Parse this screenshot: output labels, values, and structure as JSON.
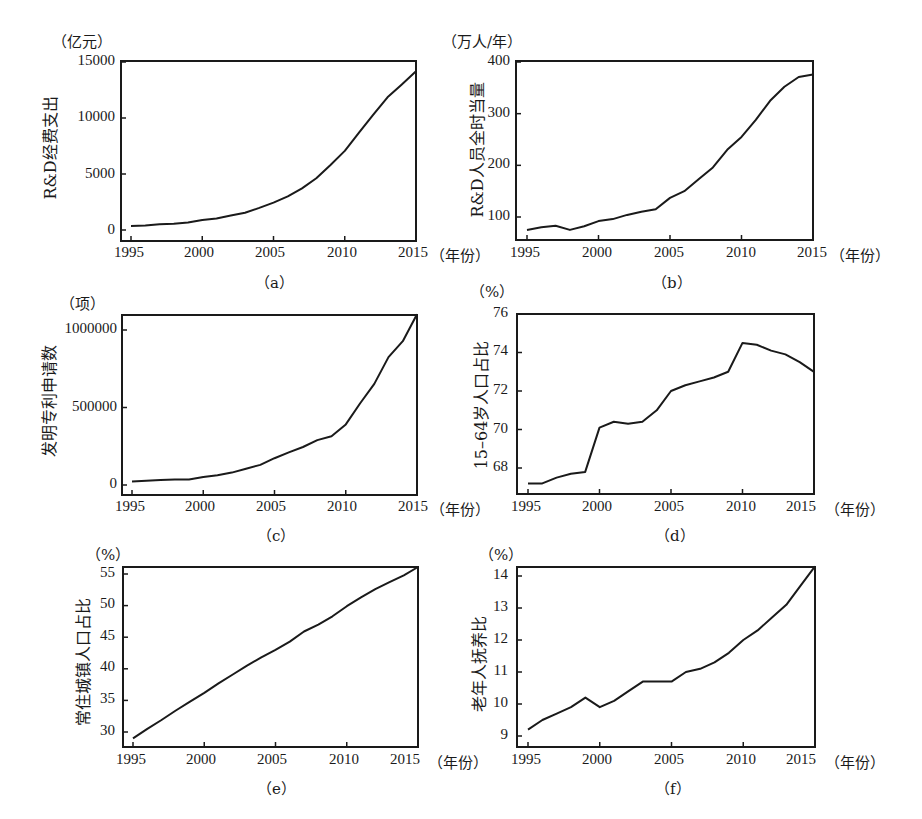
{
  "x_axis_unit": "（年份）",
  "chart_data": [
    {
      "id": "a",
      "type": "line",
      "caption": "（a）",
      "unit": "（亿元）",
      "ylabel": "R&D经费支出",
      "xlabel": "年份",
      "x_ticks": [
        "1995",
        "2000",
        "2005",
        "2010",
        "2015"
      ],
      "y_ticks": [
        "0",
        "5000",
        "10000",
        "15000"
      ],
      "ylim": [
        0,
        15000
      ],
      "xlim": [
        1995,
        2015
      ],
      "x": [
        1995,
        1996,
        1997,
        1998,
        1999,
        2000,
        2001,
        2002,
        2003,
        2004,
        2005,
        2006,
        2007,
        2008,
        2009,
        2010,
        2011,
        2012,
        2013,
        2014,
        2015
      ],
      "values": [
        350,
        400,
        510,
        550,
        680,
        900,
        1040,
        1290,
        1540,
        1970,
        2450,
        3000,
        3710,
        4620,
        5800,
        7060,
        8690,
        10300,
        11850,
        13000,
        14170
      ]
    },
    {
      "id": "b",
      "type": "line",
      "caption": "（b）",
      "unit": "（万人/年）",
      "ylabel": "R&D人员全时当量",
      "xlabel": "年份",
      "x_ticks": [
        "1995",
        "2000",
        "2005",
        "2010",
        "2015"
      ],
      "y_ticks": [
        "100",
        "200",
        "300",
        "400"
      ],
      "ylim": [
        55,
        400
      ],
      "xlim": [
        1995,
        2015
      ],
      "x": [
        1995,
        1996,
        1997,
        1998,
        1999,
        2000,
        2001,
        2002,
        2003,
        2004,
        2005,
        2006,
        2007,
        2008,
        2009,
        2010,
        2011,
        2012,
        2013,
        2014,
        2015
      ],
      "values": [
        75,
        80,
        83,
        75,
        82,
        92,
        96,
        104,
        110,
        115,
        137,
        150,
        173,
        196,
        230,
        255,
        288,
        325,
        352,
        371,
        376
      ]
    },
    {
      "id": "c",
      "type": "line",
      "caption": "（c）",
      "unit": "（项）",
      "ylabel": "发明专利申请数",
      "xlabel": "年份",
      "x_ticks": [
        "1995",
        "2000",
        "2005",
        "2010",
        "2015"
      ],
      "y_ticks": [
        "0",
        "500000",
        "1000000"
      ],
      "ylim": [
        -30000,
        1100000
      ],
      "xlim": [
        1995,
        2015
      ],
      "x": [
        1995,
        1996,
        1997,
        1998,
        1999,
        2000,
        2001,
        2002,
        2003,
        2004,
        2005,
        2006,
        2007,
        2008,
        2009,
        2010,
        2011,
        2012,
        2013,
        2014,
        2015
      ],
      "values": [
        22000,
        28000,
        33000,
        35000,
        36000,
        52000,
        63000,
        80000,
        105000,
        130000,
        173000,
        210000,
        245000,
        290000,
        315000,
        391000,
        526000,
        652000,
        825000,
        928000,
        1102000
      ]
    },
    {
      "id": "d",
      "type": "line",
      "caption": "（d）",
      "unit": "（%）",
      "ylabel": "15–64岁人口占比",
      "xlabel": "年份",
      "x_ticks": [
        "1995",
        "2000",
        "2005",
        "2010",
        "2015"
      ],
      "y_ticks": [
        "68",
        "70",
        "72",
        "74",
        "76"
      ],
      "ylim": [
        66.7,
        76
      ],
      "xlim": [
        1995,
        2015
      ],
      "x": [
        1995,
        1996,
        1997,
        1998,
        1999,
        2000,
        2001,
        2002,
        2003,
        2004,
        2005,
        2006,
        2007,
        2008,
        2009,
        2010,
        2011,
        2012,
        2013,
        2014,
        2015
      ],
      "values": [
        67.2,
        67.2,
        67.5,
        67.7,
        67.8,
        70.1,
        70.4,
        70.3,
        70.4,
        71.0,
        72.0,
        72.3,
        72.5,
        72.7,
        73.0,
        74.5,
        74.4,
        74.1,
        73.9,
        73.5,
        73.0
      ]
    },
    {
      "id": "e",
      "type": "line",
      "caption": "（e）",
      "unit": "（%）",
      "ylabel": "常住城镇人口占比",
      "xlabel": "年份",
      "x_ticks": [
        "1995",
        "2000",
        "2005",
        "2010",
        "2015"
      ],
      "y_ticks": [
        "30",
        "35",
        "40",
        "45",
        "50",
        "55"
      ],
      "ylim": [
        27.5,
        56.2
      ],
      "xlim": [
        1995,
        2015
      ],
      "x": [
        1995,
        1996,
        1997,
        1998,
        1999,
        2000,
        2001,
        2002,
        2003,
        2004,
        2005,
        2006,
        2007,
        2008,
        2009,
        2010,
        2011,
        2012,
        2013,
        2014,
        2015
      ],
      "values": [
        29.0,
        30.5,
        31.9,
        33.4,
        34.8,
        36.2,
        37.7,
        39.1,
        40.5,
        41.8,
        43.0,
        44.3,
        45.9,
        47.0,
        48.3,
        49.9,
        51.3,
        52.6,
        53.7,
        54.8,
        56.1
      ]
    },
    {
      "id": "f",
      "type": "line",
      "caption": "（f）",
      "unit": "（%）",
      "ylabel": "老年人抚养比",
      "xlabel": "年份",
      "x_ticks": [
        "1995",
        "2000",
        "2005",
        "2010",
        "2015"
      ],
      "y_ticks": [
        "9",
        "10",
        "11",
        "12",
        "13",
        "14"
      ],
      "ylim": [
        8.7,
        14.3
      ],
      "xlim": [
        1995,
        2015
      ],
      "x": [
        1995,
        1996,
        1997,
        1998,
        1999,
        2000,
        2001,
        2002,
        2003,
        2004,
        2005,
        2006,
        2007,
        2008,
        2009,
        2010,
        2011,
        2012,
        2013,
        2014,
        2015
      ],
      "values": [
        9.2,
        9.5,
        9.7,
        9.9,
        10.2,
        9.9,
        10.1,
        10.4,
        10.7,
        10.7,
        10.7,
        11.0,
        11.1,
        11.3,
        11.6,
        12.0,
        12.3,
        12.7,
        13.1,
        13.7,
        14.3
      ]
    }
  ]
}
